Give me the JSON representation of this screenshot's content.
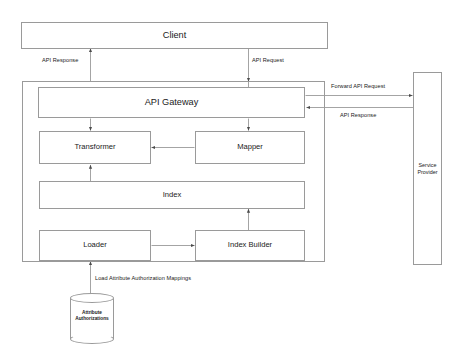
{
  "diagram": {
    "stroke_color": "#9a9a9a",
    "text_color": "#1a1a1a",
    "background_color": "#ffffff",
    "nodes": {
      "client": {
        "label": "Client"
      },
      "gateway_container": {
        "label": ""
      },
      "api_gateway": {
        "label": "API Gateway"
      },
      "transformer": {
        "label": "Transformer"
      },
      "mapper": {
        "label": "Mapper"
      },
      "index": {
        "label": "Index"
      },
      "loader": {
        "label": "Loader"
      },
      "index_builder": {
        "label": "Index Builder"
      },
      "service_provider": {
        "label": "Service\nProvider"
      },
      "attribute_authorizations_store": {
        "label": "Attribute\nAuthorizations"
      }
    },
    "edges": {
      "api_response_client": {
        "label": "API Response"
      },
      "api_request_client": {
        "label": "API Request"
      },
      "forward_api_request": {
        "label": "Forward API Request"
      },
      "api_response_provider": {
        "label": "API Response"
      },
      "load_mappings": {
        "label": "Load Attribute Authorization Mappings"
      }
    }
  }
}
